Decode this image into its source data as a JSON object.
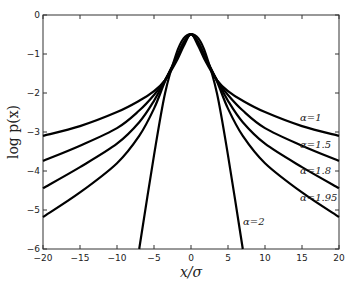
{
  "chart_data": {
    "type": "line",
    "title": "",
    "xlabel": "x/σ",
    "ylabel": "log p(x)",
    "xlim": [
      -20,
      20
    ],
    "ylim": [
      -6,
      0
    ],
    "xticks": [
      -20,
      -15,
      -10,
      -5,
      0,
      5,
      10,
      15,
      20
    ],
    "yticks": [
      0,
      -1,
      -2,
      -3,
      -4,
      -5,
      -6
    ],
    "grid": false,
    "legend": "inline labels at right",
    "x": [
      -20,
      -15,
      -10,
      -7,
      -5,
      -3.5,
      -2,
      -1,
      0,
      1,
      2,
      3.5,
      5,
      7,
      10,
      15,
      20
    ],
    "series": [
      {
        "name": "α=1",
        "label": "α=1",
        "values": [
          -3.1,
          -2.85,
          -2.49,
          -2.2,
          -1.95,
          -1.67,
          -1.2,
          -0.8,
          -0.49,
          -0.8,
          -1.2,
          -1.67,
          -1.95,
          -2.2,
          -2.49,
          -2.85,
          -3.1
        ]
      },
      {
        "name": "α=1.5",
        "label": "α=1.5",
        "values": [
          -3.74,
          -3.35,
          -2.9,
          -2.45,
          -2.05,
          -1.67,
          -1.15,
          -0.75,
          -0.49,
          -0.75,
          -1.15,
          -1.67,
          -2.05,
          -2.45,
          -2.9,
          -3.35,
          -3.74
        ]
      },
      {
        "name": "α=1.8",
        "label": "α=1.8",
        "values": [
          -4.44,
          -3.9,
          -3.3,
          -2.75,
          -2.2,
          -1.67,
          -1.12,
          -0.72,
          -0.49,
          -0.72,
          -1.12,
          -1.67,
          -2.2,
          -2.75,
          -3.3,
          -3.9,
          -4.44
        ]
      },
      {
        "name": "α=1.95",
        "label": "α=1.95",
        "values": [
          -5.18,
          -4.55,
          -3.8,
          -3.1,
          -2.4,
          -1.7,
          -1.1,
          -0.7,
          -0.49,
          -0.7,
          -1.1,
          -1.7,
          -2.4,
          -3.1,
          -3.8,
          -4.55,
          -5.18
        ]
      },
      {
        "name": "α=2",
        "label": "α=2",
        "values": [
          null,
          null,
          null,
          -6.0,
          -3.6,
          -2.0,
          -1.0,
          -0.6,
          -0.49,
          -0.6,
          -1.0,
          -2.0,
          -3.6,
          -6.0,
          null,
          null,
          null
        ]
      }
    ]
  }
}
